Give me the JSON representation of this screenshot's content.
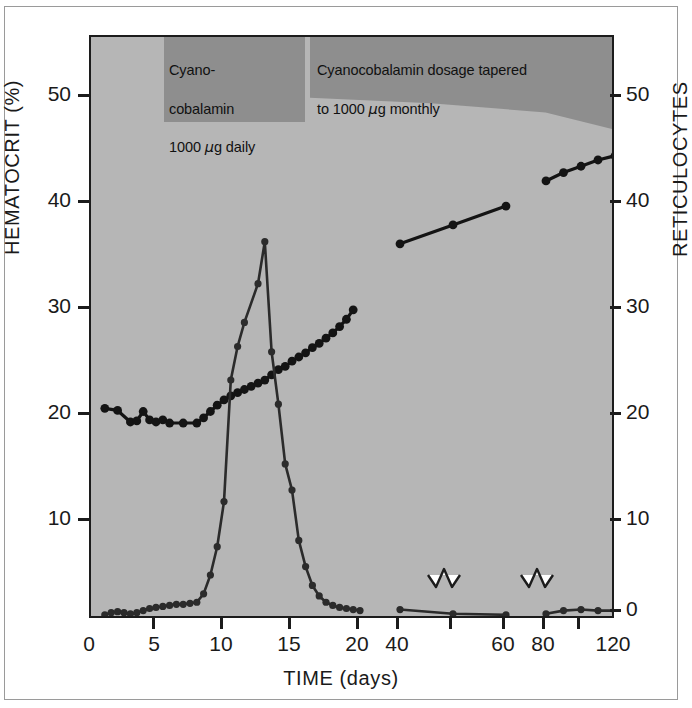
{
  "figure": {
    "background_color": "#ffffff",
    "plot_background_color": "#b6b6b6",
    "band_color": "#8e8e8e",
    "ink_color": "#141414"
  },
  "annotations": {
    "daily": "Cyano-\ncobalamin\n1000 µg daily",
    "daily_line1": "Cyano-",
    "daily_line2": "cobalamin",
    "daily_line3_pre": "1000 ",
    "daily_line3_mu": "µ",
    "daily_line3_post": "g daily",
    "tapered_line1": "Cyanocobalamin dosage tapered",
    "tapered_line2_pre": "to 1000 ",
    "tapered_line2_mu": "µ",
    "tapered_line2_post": "g monthly"
  },
  "axes": {
    "y_left_label": "HEMATOCRIT (%)",
    "y_right_label": "RETICULOCYTES",
    "x_label": "TIME (days)",
    "y_left_ticks": [
      "10",
      "20",
      "30",
      "40",
      "50"
    ],
    "y_right_ticks": [
      "0",
      "10",
      "20",
      "30",
      "40",
      "50"
    ],
    "x_ticks": [
      "0",
      "5",
      "10",
      "15",
      "20",
      "40",
      "60",
      "80",
      "120"
    ]
  },
  "chart_data": {
    "type": "line",
    "title": "",
    "subtitle": "",
    "xlabel": "TIME (days)",
    "ylabel": "HEMATOCRIT (%)",
    "ylabel_secondary": "RETICULOCYTES",
    "grid": false,
    "legend_position": "none",
    "xlim": [
      0,
      120
    ],
    "ylim": [
      0,
      55
    ],
    "ylim_secondary": [
      0,
      55
    ],
    "x_axis_broken": true,
    "x_axis_breaks": [
      [
        20,
        40
      ],
      [
        60,
        80
      ]
    ],
    "x_tick_values": [
      0,
      5,
      10,
      15,
      20,
      40,
      60,
      80,
      120
    ],
    "y_left_tick_values": [
      10,
      20,
      30,
      40,
      50
    ],
    "y_right_tick_values": [
      0,
      10,
      20,
      30,
      40,
      50
    ],
    "annotations": [
      {
        "text": "Cyanocobalamin 1000 µg daily",
        "x_start": 8,
        "x_end": 14.5,
        "position": "top-band"
      },
      {
        "text": "Cyanocobalamin dosage tapered to 1000 µg monthly",
        "x_start": 15,
        "x_end": 120,
        "position": "top-band"
      }
    ],
    "series": [
      {
        "name": "Hematocrit (%)",
        "axis": "left",
        "marker": "filled-circle",
        "segments": [
          {
            "x": [
              1,
              2,
              3,
              3.5,
              4,
              4.5,
              5,
              5.5,
              6,
              7,
              8,
              8.5,
              9,
              9.5,
              10,
              10.5,
              11,
              11.5,
              12,
              12.5,
              13,
              13.5,
              14,
              14.5,
              15,
              15.5,
              16,
              16.5,
              17,
              17.5,
              18,
              18.5,
              19,
              19.5
            ],
            "y": [
              20.1,
              19.9,
              18.8,
              18.9,
              19.8,
              19.0,
              18.8,
              19.0,
              18.7,
              18.7,
              18.7,
              19.2,
              19.8,
              20.4,
              20.9,
              21.3,
              21.6,
              21.9,
              22.2,
              22.5,
              22.8,
              23.3,
              23.8,
              24.1,
              24.6,
              25.0,
              25.4,
              25.9,
              26.3,
              26.8,
              27.3,
              27.9,
              28.6,
              29.5
            ]
          },
          {
            "x": [
              40,
              50,
              60
            ],
            "y": [
              35.8,
              37.6,
              39.4
            ]
          },
          {
            "x": [
              80,
              90,
              100,
              110,
              120
            ],
            "y": [
              41.8,
              42.6,
              43.2,
              43.8,
              44.2
            ]
          }
        ]
      },
      {
        "name": "Reticulocytes (%)",
        "axis": "right",
        "marker": "filled-circle",
        "segments": [
          {
            "x": [
              1,
              1.5,
              2,
              2.5,
              3,
              3.5,
              4,
              4.5,
              5,
              5.5,
              6,
              6.5,
              7,
              7.5,
              8,
              8.5,
              9,
              9.5,
              10,
              10.5,
              11,
              11.5,
              12.5,
              13,
              13.5,
              14,
              14.5,
              15,
              15.5,
              16,
              16.5,
              17,
              17.5,
              18,
              18.5,
              19,
              19.5,
              20
            ],
            "y": [
              0.4,
              0.6,
              0.7,
              0.6,
              0.5,
              0.6,
              0.8,
              1.0,
              1.1,
              1.2,
              1.3,
              1.4,
              1.4,
              1.5,
              1.6,
              2.4,
              4.2,
              6.9,
              11.2,
              22.8,
              26.0,
              28.3,
              32.0,
              36.0,
              25.5,
              20.5,
              14.8,
              12.3,
              7.5,
              5.0,
              3.2,
              2.2,
              1.6,
              1.3,
              1.1,
              1.0,
              0.9,
              0.8
            ]
          },
          {
            "x": [
              40,
              50,
              60
            ],
            "y": [
              0.9,
              0.5,
              0.4
            ]
          },
          {
            "x": [
              80,
              90,
              100,
              110,
              120
            ],
            "y": [
              0.5,
              0.8,
              0.9,
              0.8,
              0.8
            ]
          }
        ]
      }
    ]
  }
}
